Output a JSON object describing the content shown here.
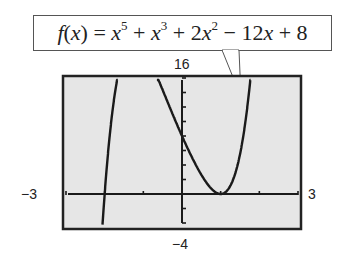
{
  "callout": {
    "formula_text": "f(x) = x^5 + x^3 + 2x^2 − 12x + 8"
  },
  "window": {
    "ymax_label": "16",
    "ymin_label": "−4",
    "xmin_label": "−3",
    "xmax_label": "3"
  },
  "colors": {
    "screen_bg": "#e6e6e6",
    "curve": "#1a1a1a",
    "border": "#222222"
  },
  "chart_data": {
    "type": "line",
    "xlabel": "",
    "ylabel": "",
    "xlim": [
      -3,
      3
    ],
    "ylim": [
      -4,
      16
    ],
    "xscl": 1,
    "yscl": 2,
    "grid": false,
    "legend": "none",
    "series": [
      {
        "name": "f(x)",
        "x": [
          -2.4,
          -2.3,
          -2.2,
          -2.1,
          -2.0,
          -1.9,
          -1.5,
          -1.0,
          -0.8,
          -0.6,
          -0.4,
          -0.2,
          0.0,
          0.2,
          0.4,
          0.6,
          0.8,
          1.0,
          1.2,
          1.4,
          1.5,
          1.6
        ],
        "y": [
          -27.0,
          -18.0,
          -10.9,
          -5.0,
          0.0,
          4.1,
          15.5,
          20.0,
          17.9,
          15.3,
          12.6,
          10.3,
          8.0,
          5.7,
          3.6,
          1.8,
          0.5,
          0.0,
          0.8,
          4.0,
          7.2,
          11.5
        ]
      }
    ],
    "roots": [
      -2,
      1
    ],
    "y_intercept": 8
  }
}
